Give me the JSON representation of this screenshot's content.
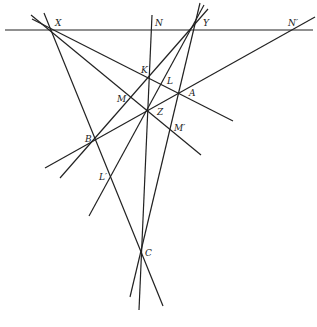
{
  "diagram": {
    "type": "projective-geometry-figure",
    "points": [
      {
        "id": "X",
        "label": "X"
      },
      {
        "id": "N",
        "label": "N"
      },
      {
        "id": "Y",
        "label": "Y"
      },
      {
        "id": "N2",
        "label": "N′"
      },
      {
        "id": "K",
        "label": "K"
      },
      {
        "id": "L",
        "label": "L"
      },
      {
        "id": "A",
        "label": "A"
      },
      {
        "id": "M",
        "label": "M"
      },
      {
        "id": "Z",
        "label": "Z"
      },
      {
        "id": "M2",
        "label": "M′"
      },
      {
        "id": "B",
        "label": "B"
      },
      {
        "id": "L2",
        "label": "L′"
      },
      {
        "id": "C",
        "label": "C"
      }
    ]
  }
}
